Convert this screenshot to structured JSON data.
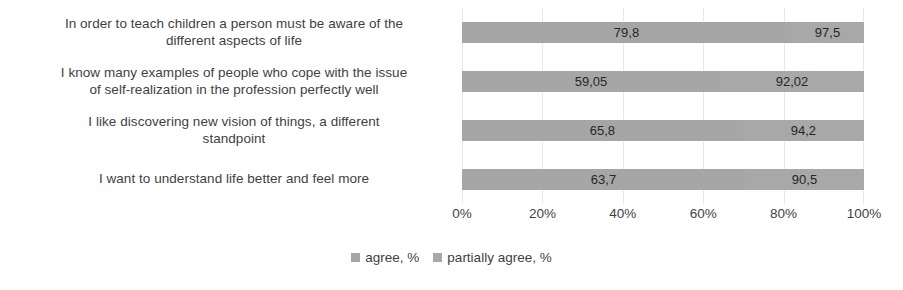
{
  "chart_data": {
    "type": "bar",
    "subtype": "stacked-bar-100-horizontal",
    "orientation": "horizontal",
    "title": "",
    "xlabel": "",
    "ylabel": "",
    "xlim": [
      0,
      100
    ],
    "grid": true,
    "legend_position": "bottom",
    "xtick_labels": [
      "0%",
      "20%",
      "40%",
      "60%",
      "80%",
      "100%"
    ],
    "xtick_values": [
      0,
      20,
      40,
      60,
      80,
      100
    ],
    "categories": [
      "In order to teach children a person must be aware of the different aspects of life",
      "I know many examples of people who cope with the issue of self-realization in the profession perfectly well",
      "I like discovering new vision of things, a different standpoint",
      "I want to understand life better and feel more"
    ],
    "series": [
      {
        "name": "agree, %",
        "color": "#a6a6a6",
        "values": [
          79.8,
          59.05,
          65.8,
          63.7
        ],
        "labels": [
          "79,8",
          "59,05",
          "65,8",
          "63,7"
        ]
      },
      {
        "name": "partially agree, %",
        "color": "#a8a8a8",
        "values": [
          97.5,
          92.02,
          94.2,
          90.5
        ],
        "labels": [
          "97,5",
          "92,02",
          "94,2",
          "90,5"
        ]
      }
    ]
  },
  "category_label_lines": [
    [
      "In order to teach children a person must be aware of the",
      "different aspects of life"
    ],
    [
      "I know many examples of people who cope with the issue",
      "of self-realization in the profession perfectly well"
    ],
    [
      "I like discovering new vision of things, a different",
      "standpoint"
    ],
    [
      "I want to understand life better and feel more"
    ]
  ],
  "colors": {
    "bar_agree": "#a6a6a6",
    "bar_partially_agree": "#a8a8a8",
    "gridline": "#e9e9e9",
    "text": "#3f3f3f",
    "data_label_text": "#262626",
    "background": "#ffffff"
  }
}
